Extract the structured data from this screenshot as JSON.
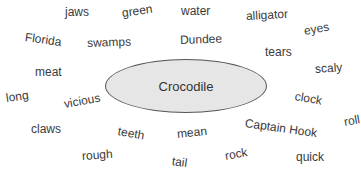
{
  "diagram": {
    "type": "word-cloud / brainstorm",
    "center": {
      "label": "Crocodile",
      "fill": "#e6e6e6",
      "stroke": "#555555"
    },
    "words": [
      {
        "text": "jaws",
        "x": 65,
        "y": 6,
        "rot": 0
      },
      {
        "text": "green",
        "x": 122,
        "y": 7,
        "rot": -8
      },
      {
        "text": "water",
        "x": 181,
        "y": 5,
        "rot": 0
      },
      {
        "text": "alligator",
        "x": 246,
        "y": 10,
        "rot": -3
      },
      {
        "text": "eyes",
        "x": 304,
        "y": 25,
        "rot": -10
      },
      {
        "text": "Florida",
        "x": 25,
        "y": 31,
        "rot": 8
      },
      {
        "text": "swamps",
        "x": 87,
        "y": 37,
        "rot": -2
      },
      {
        "text": "Dundee",
        "x": 180,
        "y": 34,
        "rot": -2
      },
      {
        "text": "tears",
        "x": 265,
        "y": 46,
        "rot": 0
      },
      {
        "text": "scaly",
        "x": 315,
        "y": 63,
        "rot": -4
      },
      {
        "text": "meat",
        "x": 35,
        "y": 66,
        "rot": 0
      },
      {
        "text": "long",
        "x": 6,
        "y": 92,
        "rot": -8
      },
      {
        "text": "vicious",
        "x": 64,
        "y": 98,
        "rot": -10
      },
      {
        "text": "clock",
        "x": 295,
        "y": 90,
        "rot": 10
      },
      {
        "text": "roll",
        "x": 344,
        "y": 116,
        "rot": -10
      },
      {
        "text": "claws",
        "x": 31,
        "y": 123,
        "rot": 0
      },
      {
        "text": "teeth",
        "x": 118,
        "y": 125,
        "rot": 10
      },
      {
        "text": "mean",
        "x": 177,
        "y": 128,
        "rot": -6
      },
      {
        "text": "Captain Hook",
        "x": 245,
        "y": 117,
        "rot": 8
      },
      {
        "text": "rough",
        "x": 82,
        "y": 150,
        "rot": -4
      },
      {
        "text": "tail",
        "x": 172,
        "y": 155,
        "rot": 8
      },
      {
        "text": "rock",
        "x": 225,
        "y": 150,
        "rot": -10
      },
      {
        "text": "quick",
        "x": 296,
        "y": 151,
        "rot": 0
      }
    ]
  }
}
